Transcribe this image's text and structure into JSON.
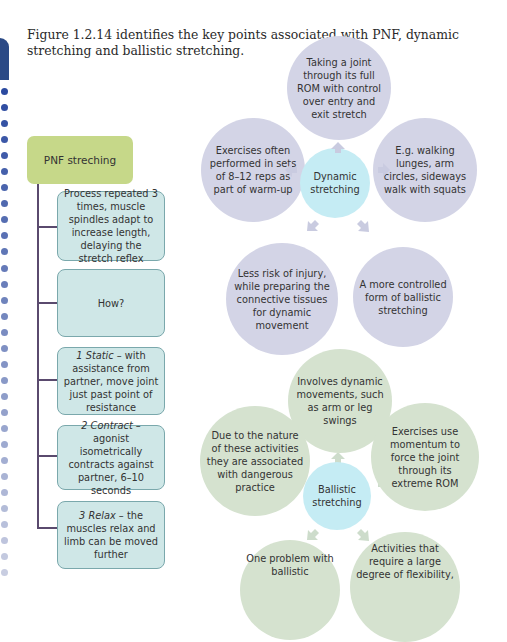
{
  "caption": "Figure 1.2.14 identifies the key points associated with PNF, dynamic stretching and ballistic stretching.",
  "colors": {
    "tab": "#2b4a86",
    "pnf_header": "#c6d889",
    "pnf_box": "#cfe7e7",
    "pnf_box_border": "#7aa8ac",
    "connector": "#5a4a6e",
    "dynamic_outer": "#d3d4e6",
    "ballistic_outer": "#d5e2cf",
    "center": "#c5ecf4"
  },
  "pnf": {
    "title": "PNF streching",
    "boxes": [
      {
        "text": "Process repeated 3 times, muscle spindles adapt to increase length, delaying the stretch reflex"
      },
      {
        "text": "How?"
      },
      {
        "lead": "1 Static",
        "text": " – with assistance from partner, move joint just past point of resistance"
      },
      {
        "lead": "2 Contract",
        "text": " – agonist isometrically contracts against partner, 6–10 seconds"
      },
      {
        "lead": "3 Relax",
        "text": " – the muscles relax and limb can be moved further"
      }
    ]
  },
  "dynamic": {
    "center": "Dynamic stretching",
    "top": "Taking a joint through its full ROM with control over entry and exit stretch",
    "left": "Exercises often performed in sets of 8–12 reps as part of warm-up",
    "right": "E.g. walking lunges, arm circles, sideways walk with squats",
    "bottom_left": "Less risk of injury, while preparing the connective tissues for dynamic movement",
    "bottom_right": "A more controlled form of ballistic stretching"
  },
  "ballistic": {
    "center": "Ballistic stretching",
    "top": "Involves dynamic movements, such as arm or leg swings",
    "left": "Due to the nature of these activities they are associated with dangerous practice",
    "right": "Exercises use momentum to force the joint through its extreme ROM",
    "bottom_left": "One problem with ballistic",
    "bottom_right": "Activities that require a large degree of flexibility,"
  }
}
